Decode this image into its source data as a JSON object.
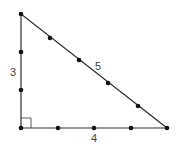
{
  "diagram": {
    "type": "right-triangle",
    "colors": {
      "line": "#333333",
      "dot": "#111111",
      "label": "#444444"
    },
    "vertices": {
      "top": [
        21,
        14
      ],
      "right_angle": [
        21,
        128
      ],
      "right": [
        167,
        128
      ]
    },
    "right_angle_marker_size": 10,
    "sides": [
      {
        "name": "vertical-leg",
        "label": "3",
        "label_pos": [
          13,
          76
        ],
        "dots": [
          [
            21,
            52
          ],
          [
            21,
            90
          ]
        ]
      },
      {
        "name": "horizontal-leg",
        "label": "4",
        "label_pos": [
          94,
          142
        ],
        "dots": [
          [
            58,
            128
          ],
          [
            94,
            128
          ],
          [
            131,
            128
          ]
        ]
      },
      {
        "name": "hypotenuse",
        "label": "5",
        "label_pos": [
          98,
          70
        ],
        "dots": [
          [
            50,
            38
          ],
          [
            79,
            60
          ],
          [
            108,
            83
          ],
          [
            138,
            106
          ]
        ]
      }
    ]
  }
}
